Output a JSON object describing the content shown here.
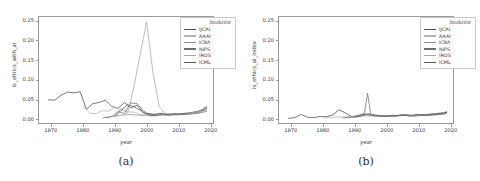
{
  "figure": {
    "panels": [
      {
        "caption": "(a)",
        "name": "panel-a"
      },
      {
        "caption": "(b)",
        "name": "panel-b"
      }
    ]
  },
  "legend": {
    "title": "booktitle",
    "entries": [
      {
        "label": "IJCAI",
        "color": "#4c4c4c"
      },
      {
        "label": "AAAI",
        "color": "#b4b4b4"
      },
      {
        "label": "ICRA",
        "color": "#909090"
      },
      {
        "label": "NIPS",
        "color": "#6e6e6e"
      },
      {
        "label": "IROS",
        "color": "#a6a6a6"
      },
      {
        "label": "ICML",
        "color": "#585858"
      }
    ]
  },
  "chart_data": [
    {
      "type": "line",
      "panel": "a",
      "title": "",
      "xlabel": "year",
      "ylabel": "is_ethics_with_ai",
      "xlim": [
        1966,
        2021
      ],
      "ylim": [
        -0.012,
        0.262
      ],
      "xticks": [
        1970,
        1980,
        1990,
        2000,
        2010,
        2020
      ],
      "xticklabels": [
        "1970",
        "1980",
        "1990",
        "2000",
        "2010",
        "2020"
      ],
      "yticks": [
        0.0,
        0.05,
        0.1,
        0.15,
        0.2,
        0.25
      ],
      "yticklabels": [
        "0.00",
        "0.05",
        "0.10",
        "0.15",
        "0.20",
        "0.25"
      ],
      "grid": false,
      "legend_position": "upper right",
      "series": [
        {
          "name": "IJCAI",
          "color": "#4c4c4c",
          "x": [
            1969,
            1971,
            1973,
            1975,
            1977,
            1979,
            1981,
            1983,
            1985,
            1987,
            1989,
            1991,
            1993,
            1995,
            1997,
            1999,
            2001,
            2003,
            2005,
            2007,
            2009,
            2011,
            2013,
            2015,
            2016,
            2017,
            2018,
            2019
          ],
          "y": [
            0.048,
            0.047,
            0.06,
            0.068,
            0.066,
            0.069,
            0.023,
            0.038,
            0.041,
            0.047,
            0.031,
            0.026,
            0.041,
            0.027,
            0.034,
            0.014,
            0.012,
            0.01,
            0.012,
            0.009,
            0.011,
            0.01,
            0.012,
            0.013,
            0.015,
            0.018,
            0.026,
            0.03
          ]
        },
        {
          "name": "AAAI",
          "color": "#b4b4b4",
          "x": [
            1980,
            1982,
            1984,
            1986,
            1988,
            1990,
            1992,
            1994,
            1996,
            1998,
            2000,
            2002,
            2004,
            2006,
            2008,
            2010,
            2012,
            2014,
            2016,
            2018,
            2019
          ],
          "y": [
            0.033,
            0.013,
            0.012,
            0.02,
            0.019,
            0.028,
            0.022,
            0.017,
            0.016,
            0.01,
            0.009,
            0.008,
            0.01,
            0.011,
            0.009,
            0.01,
            0.012,
            0.013,
            0.016,
            0.02,
            0.022
          ]
        },
        {
          "name": "ICRA",
          "color": "#909090",
          "x": [
            1986,
            1988,
            1990,
            1992,
            1994,
            1996,
            1998,
            2000,
            2002,
            2004,
            2006,
            2008,
            2010,
            2012,
            2014,
            2016,
            2018,
            2019
          ],
          "y": [
            0.001,
            0.003,
            0.006,
            0.008,
            0.01,
            0.009,
            0.008,
            0.007,
            0.006,
            0.008,
            0.009,
            0.008,
            0.009,
            0.01,
            0.011,
            0.013,
            0.016,
            0.018
          ]
        },
        {
          "name": "NIPS",
          "color": "#6e6e6e",
          "x": [
            1987,
            1989,
            1991,
            1993,
            1995,
            1997,
            1999,
            2001,
            2003,
            2005,
            2007,
            2009,
            2011,
            2013,
            2015,
            2017,
            2018,
            2019
          ],
          "y": [
            0.002,
            0.005,
            0.018,
            0.012,
            0.04,
            0.038,
            0.02,
            0.008,
            0.007,
            0.01,
            0.008,
            0.012,
            0.01,
            0.011,
            0.013,
            0.015,
            0.02,
            0.024
          ]
        },
        {
          "name": "IROS",
          "color": "#a6a6a6",
          "x": [
            1988,
            1990,
            1992,
            1994,
            1996,
            1998,
            2000,
            2002,
            2004,
            2006,
            2008,
            2010,
            2012,
            2014,
            2016,
            2018,
            2019
          ],
          "y": [
            0.003,
            0.007,
            0.026,
            0.014,
            0.082,
            0.166,
            0.249,
            0.12,
            0.03,
            0.012,
            0.01,
            0.011,
            0.013,
            0.012,
            0.014,
            0.017,
            0.019
          ]
        },
        {
          "name": "ICML",
          "color": "#585858",
          "x": [
            1990,
            1992,
            1994,
            1996,
            1998,
            2000,
            2002,
            2004,
            2006,
            2008,
            2010,
            2012,
            2014,
            2016,
            2018,
            2019
          ],
          "y": [
            0.004,
            0.021,
            0.035,
            0.03,
            0.021,
            0.011,
            0.009,
            0.013,
            0.01,
            0.012,
            0.011,
            0.013,
            0.015,
            0.018,
            0.023,
            0.028
          ]
        }
      ],
      "annotations": {
        "peak_series": "IROS",
        "peak_year": 2000,
        "peak_value": 0.249
      }
    },
    {
      "type": "line",
      "panel": "b",
      "title": "",
      "xlabel": "year",
      "ylabel": "is_ethics_ai_index",
      "xlim": [
        1966,
        2021
      ],
      "ylim": [
        -0.012,
        0.262
      ],
      "xticks": [
        1970,
        1980,
        1990,
        2000,
        2010,
        2020
      ],
      "xticklabels": [
        "1970",
        "1980",
        "1990",
        "2000",
        "2010",
        "2020"
      ],
      "yticks": [
        0.0,
        0.05,
        0.1,
        0.15,
        0.2,
        0.25
      ],
      "yticklabels": [
        "0.00",
        "0.05",
        "0.10",
        "0.15",
        "0.20",
        "0.25"
      ],
      "grid": false,
      "legend_position": "upper right",
      "series": [
        {
          "name": "IJCAI",
          "color": "#4c4c4c",
          "x": [
            1969,
            1971,
            1973,
            1975,
            1977,
            1979,
            1981,
            1983,
            1985,
            1987,
            1989,
            1991,
            1993,
            1995,
            1997,
            1999,
            2001,
            2003,
            2005,
            2007,
            2009,
            2011,
            2013,
            2015,
            2017,
            2018,
            2019
          ],
          "y": [
            0.0,
            0.002,
            0.01,
            0.003,
            0.002,
            0.005,
            0.004,
            0.009,
            0.022,
            0.014,
            0.004,
            0.006,
            0.011,
            0.008,
            0.006,
            0.005,
            0.007,
            0.006,
            0.009,
            0.007,
            0.006,
            0.008,
            0.007,
            0.009,
            0.01,
            0.011,
            0.013
          ]
        },
        {
          "name": "AAAI",
          "color": "#b4b4b4",
          "x": [
            1980,
            1982,
            1984,
            1986,
            1988,
            1990,
            1992,
            1994,
            1996,
            1998,
            2000,
            2002,
            2004,
            2006,
            2008,
            2010,
            2012,
            2014,
            2016,
            2018,
            2019
          ],
          "y": [
            0.001,
            0.002,
            0.003,
            0.004,
            0.003,
            0.005,
            0.007,
            0.006,
            0.005,
            0.004,
            0.006,
            0.005,
            0.007,
            0.009,
            0.006,
            0.008,
            0.007,
            0.009,
            0.011,
            0.013,
            0.014
          ]
        },
        {
          "name": "ICRA",
          "color": "#909090",
          "x": [
            1986,
            1988,
            1990,
            1992,
            1994,
            1996,
            1998,
            2000,
            2002,
            2004,
            2006,
            2008,
            2010,
            2012,
            2014,
            2016,
            2018,
            2019
          ],
          "y": [
            0.001,
            0.002,
            0.004,
            0.006,
            0.009,
            0.007,
            0.005,
            0.006,
            0.005,
            0.007,
            0.008,
            0.006,
            0.008,
            0.009,
            0.01,
            0.011,
            0.013,
            0.015
          ]
        },
        {
          "name": "NIPS",
          "color": "#6e6e6e",
          "x": [
            1987,
            1989,
            1991,
            1993,
            1994,
            1995,
            1997,
            1999,
            2001,
            2003,
            2005,
            2007,
            2009,
            2011,
            2013,
            2015,
            2017,
            2018,
            2019
          ],
          "y": [
            0.002,
            0.004,
            0.008,
            0.013,
            0.065,
            0.01,
            0.007,
            0.006,
            0.005,
            0.007,
            0.009,
            0.006,
            0.008,
            0.007,
            0.009,
            0.01,
            0.012,
            0.014,
            0.016
          ]
        },
        {
          "name": "IROS",
          "color": "#a6a6a6",
          "x": [
            1988,
            1990,
            1992,
            1994,
            1996,
            1998,
            2000,
            2002,
            2004,
            2006,
            2008,
            2010,
            2012,
            2014,
            2016,
            2018,
            2019
          ],
          "y": [
            0.002,
            0.003,
            0.007,
            0.011,
            0.008,
            0.006,
            0.007,
            0.006,
            0.008,
            0.01,
            0.007,
            0.009,
            0.01,
            0.011,
            0.013,
            0.015,
            0.017
          ]
        },
        {
          "name": "ICML",
          "color": "#585858",
          "x": [
            1990,
            1992,
            1994,
            1996,
            1998,
            2000,
            2002,
            2004,
            2006,
            2008,
            2010,
            2012,
            2014,
            2016,
            2018,
            2019
          ],
          "y": [
            0.003,
            0.006,
            0.012,
            0.009,
            0.007,
            0.006,
            0.008,
            0.007,
            0.009,
            0.008,
            0.01,
            0.009,
            0.011,
            0.012,
            0.014,
            0.016
          ]
        }
      ],
      "annotations": {
        "peak_series": "NIPS",
        "peak_year": 1994,
        "peak_value": 0.065
      }
    }
  ]
}
